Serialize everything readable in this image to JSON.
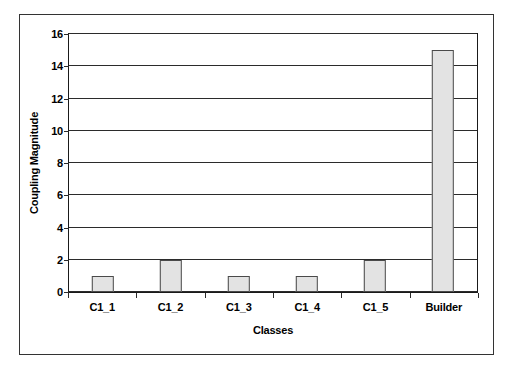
{
  "figure": {
    "background_color": "#ffffff",
    "frame_color": "#333333"
  },
  "chart_data": {
    "type": "bar",
    "title": "",
    "xlabel": "Classes",
    "ylabel": "Coupling Magnitude",
    "categories": [
      "C1_1",
      "C1_2",
      "C1_3",
      "C1_4",
      "C1_5",
      "Builder"
    ],
    "values": [
      1,
      2,
      1,
      1,
      2,
      15
    ],
    "ylim": [
      0,
      16
    ],
    "ytick_step": 2,
    "yticks": [
      0,
      2,
      4,
      6,
      8,
      10,
      12,
      14,
      16
    ],
    "ytick_labels": [
      "0",
      "2",
      "4",
      "6",
      "8",
      "10",
      "12",
      "14",
      "16"
    ],
    "grid": true,
    "grid_axis": "y",
    "legend": false,
    "legend_position": "none",
    "bar_fill_color": "#e3e3e3",
    "bar_edge_color": "#4a4a4a",
    "axis_color": "#2b2b2b"
  }
}
